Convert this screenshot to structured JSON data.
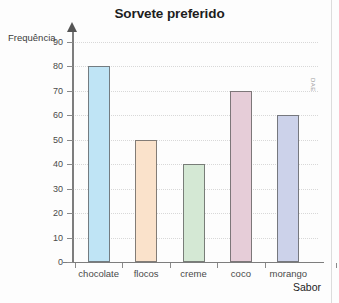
{
  "credit": "DAE",
  "chart_data": {
    "type": "bar",
    "title": "Sorvete preferido",
    "xlabel": "Sabor",
    "ylabel": "Frequência",
    "categories": [
      "chocolate",
      "flocos",
      "creme",
      "coco",
      "morango"
    ],
    "values": [
      80,
      50,
      40,
      70,
      60
    ],
    "colors": [
      "#bfe4f5",
      "#fae2cb",
      "#d4e8d4",
      "#e6cdd8",
      "#ccd2ea"
    ],
    "ylim": [
      0,
      90
    ],
    "yticks": [
      0,
      10,
      20,
      30,
      40,
      50,
      60,
      70,
      80,
      90
    ],
    "ytick_labels": [
      "0",
      "10",
      "20",
      "30",
      "40",
      "50",
      "60",
      "70",
      "80",
      "90"
    ],
    "grid": true,
    "legend": false
  }
}
